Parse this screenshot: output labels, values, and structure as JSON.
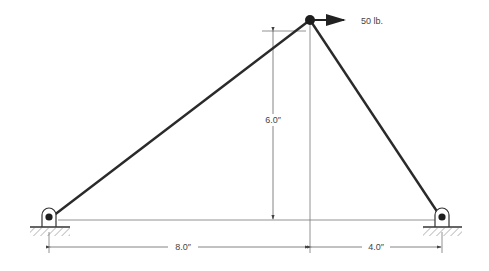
{
  "diagram": {
    "type": "truss",
    "force": {
      "label": "50 lb.",
      "direction": "right"
    },
    "dimensions": {
      "height": "6.0″",
      "left_span": "8.0″",
      "right_span": "4.0″"
    },
    "supports": [
      {
        "name": "left-pin-support"
      },
      {
        "name": "right-pin-support"
      }
    ],
    "colors": {
      "member": "#2a2a2a",
      "dimension": "#555555"
    }
  }
}
